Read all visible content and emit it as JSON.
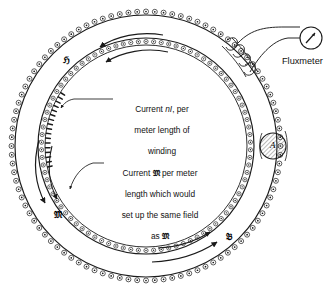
{
  "figure": {
    "type": "toroidal-solenoid-rowland-ring-diagram",
    "background_color": "#ffffff",
    "ink_color": "#1a1a1a"
  },
  "annotations": [
    {
      "id": "current-nI",
      "lines": "Current nI, per\nmeter length of\nwinding",
      "line1_prefix": "Current ",
      "line1_symbol": "nI",
      "line1_suffix": ", per",
      "line2": "meter length of",
      "line3": "winding"
    },
    {
      "id": "current-M",
      "line1_prefix": "Current ",
      "line1_symbol": "𝔐",
      "line1_suffix": " per meter",
      "line2": "length which would",
      "line3": "set up the same field",
      "line4_prefix": "as ",
      "line4_symbol": "𝔐"
    }
  ],
  "field_labels": [
    {
      "id": "H-label",
      "text": "ℌ",
      "meaning": "magnetic-field-strength"
    },
    {
      "id": "M-label",
      "text": "𝔐",
      "meaning": "magnetization"
    },
    {
      "id": "B-label",
      "text": "𝔅",
      "meaning": "magnetic-flux-density"
    }
  ],
  "instrument": {
    "name": "Fluxmeter",
    "label": "Fluxmeter",
    "dial_glyph": "needle"
  },
  "cross_section": {
    "label": "A",
    "meaning": "cross-sectional-area"
  },
  "colors": {
    "ink": "#1a1a1a",
    "paper": "#ffffff",
    "hatch": "#555555"
  }
}
